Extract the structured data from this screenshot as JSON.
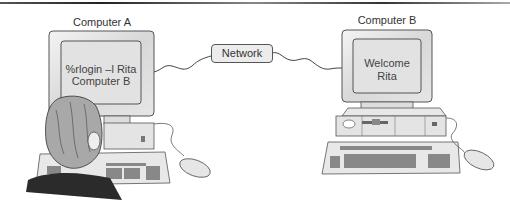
{
  "diagram": {
    "computer_a": {
      "label": "Computer A",
      "screen_line1": "%rlogin –l Rita",
      "screen_line2": "Computer B"
    },
    "computer_b": {
      "label": "Computer B",
      "screen_line1": "Welcome",
      "screen_line2": "Rita"
    },
    "network": {
      "label": "Network"
    }
  }
}
